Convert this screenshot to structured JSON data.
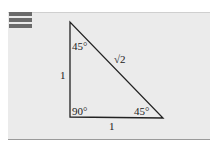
{
  "figure": {
    "type": "right-triangle",
    "angles": {
      "top": "45°",
      "right_angle": "90°",
      "bottom_right": "45°"
    },
    "sides": {
      "vertical_leg": "1",
      "horizontal_leg": "1",
      "hypotenuse": "√2"
    },
    "colors": {
      "panel": "#ebebeb",
      "accent_bars": "#6b6b6b",
      "lines": "#222222"
    }
  }
}
